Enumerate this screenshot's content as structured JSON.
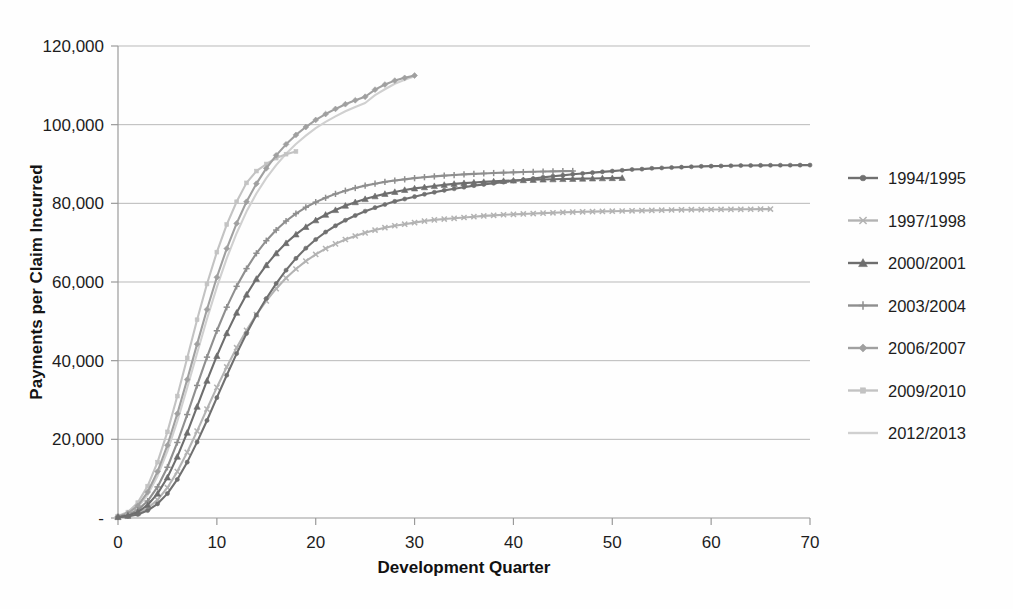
{
  "chart_data": {
    "type": "line",
    "title": "",
    "xlabel": "Development Quarter",
    "ylabel": "Payments per Claim Incurred",
    "xlim": [
      0,
      70
    ],
    "ylim": [
      0,
      120000
    ],
    "xticks": [
      0,
      10,
      20,
      30,
      40,
      50,
      60,
      70
    ],
    "xtick_labels": [
      "0",
      "10",
      "20",
      "30",
      "40",
      "50",
      "60",
      "70"
    ],
    "yticks": [
      0,
      20000,
      40000,
      60000,
      80000,
      100000,
      120000
    ],
    "ytick_labels": [
      "-",
      "20,000",
      "40,000",
      "60,000",
      "80,000",
      "100,000",
      "120,000"
    ],
    "grid": "horizontal",
    "legend_position": "right",
    "series": [
      {
        "name": "1994/1995",
        "marker": "circle",
        "color": "#707070",
        "x": [
          0,
          1,
          2,
          3,
          4,
          5,
          6,
          7,
          8,
          9,
          10,
          11,
          12,
          13,
          14,
          15,
          16,
          17,
          18,
          19,
          20,
          21,
          22,
          23,
          24,
          25,
          26,
          27,
          28,
          29,
          30,
          31,
          32,
          33,
          34,
          35,
          36,
          37,
          38,
          39,
          40,
          41,
          42,
          43,
          44,
          45,
          46,
          47,
          48,
          49,
          50,
          51,
          52,
          53,
          54,
          55,
          56,
          57,
          58,
          59,
          60,
          61,
          62,
          63,
          64,
          65,
          66,
          67,
          68,
          69,
          70
        ],
        "values": [
          200,
          400,
          900,
          1900,
          3600,
          6200,
          9800,
          14200,
          19300,
          24800,
          30600,
          36300,
          41800,
          46900,
          51600,
          55800,
          59600,
          63000,
          66000,
          68600,
          70800,
          72700,
          74300,
          75700,
          76900,
          78000,
          78900,
          79700,
          80500,
          81100,
          81700,
          82300,
          82800,
          83300,
          83700,
          84100,
          84500,
          84800,
          85100,
          85400,
          85700,
          86000,
          86300,
          86600,
          86900,
          87100,
          87400,
          87600,
          87800,
          88000,
          88200,
          88400,
          88600,
          88700,
          88900,
          89000,
          89100,
          89200,
          89300,
          89400,
          89450,
          89500,
          89550,
          89600,
          89620,
          89650,
          89670,
          89690,
          89700,
          89710,
          89720
        ]
      },
      {
        "name": "1997/1998",
        "marker": "x",
        "color": "#b3b3b3",
        "x": [
          0,
          1,
          2,
          3,
          4,
          5,
          6,
          7,
          8,
          9,
          10,
          11,
          12,
          13,
          14,
          15,
          16,
          17,
          18,
          19,
          20,
          21,
          22,
          23,
          24,
          25,
          26,
          27,
          28,
          29,
          30,
          31,
          32,
          33,
          34,
          35,
          36,
          37,
          38,
          39,
          40,
          41,
          42,
          43,
          44,
          45,
          46,
          47,
          48,
          49,
          50,
          51,
          52,
          53,
          54,
          55,
          56,
          57,
          58,
          59,
          60,
          61,
          62,
          63,
          64,
          65,
          66
        ],
        "values": [
          200,
          500,
          1200,
          2500,
          4600,
          7700,
          11800,
          16700,
          22100,
          27700,
          33200,
          38400,
          43300,
          47700,
          51700,
          55200,
          58300,
          61000,
          63300,
          65300,
          67000,
          68500,
          69700,
          70800,
          71700,
          72500,
          73200,
          73800,
          74300,
          74700,
          75100,
          75500,
          75800,
          76000,
          76200,
          76400,
          76600,
          76800,
          76950,
          77100,
          77200,
          77300,
          77400,
          77500,
          77600,
          77700,
          77780,
          77850,
          77900,
          77950,
          78000,
          78050,
          78100,
          78150,
          78200,
          78250,
          78300,
          78350,
          78380,
          78400,
          78430,
          78450,
          78470,
          78480,
          78500,
          78520,
          78540
        ]
      },
      {
        "name": "2000/2001",
        "marker": "triangle",
        "color": "#6e6e6e",
        "x": [
          0,
          1,
          2,
          3,
          4,
          5,
          6,
          7,
          8,
          9,
          10,
          11,
          12,
          13,
          14,
          15,
          16,
          17,
          18,
          19,
          20,
          21,
          22,
          23,
          24,
          25,
          26,
          27,
          28,
          29,
          30,
          31,
          32,
          33,
          34,
          35,
          36,
          37,
          38,
          39,
          40,
          41,
          42,
          43,
          44,
          45,
          46,
          47,
          48,
          49,
          50,
          51
        ],
        "values": [
          250,
          600,
          1500,
          3300,
          6200,
          10300,
          15600,
          21700,
          28300,
          34900,
          41200,
          47000,
          52200,
          56800,
          60800,
          64300,
          67300,
          69900,
          72100,
          74000,
          75700,
          77100,
          78300,
          79400,
          80300,
          81100,
          81800,
          82400,
          82900,
          83400,
          83800,
          84100,
          84400,
          84700,
          84950,
          85150,
          85300,
          85450,
          85580,
          85700,
          85800,
          85900,
          85980,
          86050,
          86120,
          86180,
          86230,
          86280,
          86330,
          86380,
          86420,
          86460
        ]
      },
      {
        "name": "2003/2004",
        "marker": "plus",
        "color": "#8f8f8f",
        "x": [
          0,
          1,
          2,
          3,
          4,
          5,
          6,
          7,
          8,
          9,
          10,
          11,
          12,
          13,
          14,
          15,
          16,
          17,
          18,
          19,
          20,
          21,
          22,
          23,
          24,
          25,
          26,
          27,
          28,
          29,
          30,
          31,
          32,
          33,
          34,
          35,
          36,
          37,
          38,
          39,
          40,
          41,
          42,
          43,
          44,
          45,
          46
        ],
        "values": [
          300,
          800,
          2000,
          4300,
          7900,
          12900,
          19200,
          26300,
          33700,
          40900,
          47600,
          53600,
          58900,
          63400,
          67300,
          70500,
          73200,
          75500,
          77400,
          79000,
          80300,
          81400,
          82400,
          83200,
          83900,
          84500,
          85000,
          85450,
          85800,
          86100,
          86400,
          86650,
          86850,
          87050,
          87200,
          87350,
          87480,
          87600,
          87700,
          87800,
          87880,
          87950,
          88020,
          88080,
          88130,
          88180,
          88220
        ]
      },
      {
        "name": "2006/2007",
        "marker": "diamond",
        "color": "#a0a0a0",
        "x": [
          0,
          1,
          2,
          3,
          4,
          5,
          6,
          7,
          8,
          9,
          10,
          11,
          12,
          13,
          14,
          15,
          16,
          17,
          18,
          19,
          20,
          21,
          22,
          23,
          24,
          25,
          26,
          27,
          28,
          29,
          30
        ],
        "values": [
          400,
          1200,
          3100,
          6600,
          11800,
          18500,
          26500,
          35200,
          44200,
          53000,
          61200,
          68500,
          74900,
          80400,
          85000,
          88900,
          92200,
          95000,
          97400,
          99400,
          101200,
          102700,
          104000,
          105200,
          106200,
          107100,
          108900,
          110200,
          111200,
          111900,
          112500
        ]
      },
      {
        "name": "2009/2010",
        "marker": "square",
        "color": "#c3c3c3",
        "x": [
          0,
          1,
          2,
          3,
          4,
          5,
          6,
          7,
          8,
          9,
          10,
          11,
          12,
          13,
          14,
          15,
          16,
          17,
          18
        ],
        "values": [
          500,
          1500,
          3900,
          8100,
          14200,
          21900,
          31000,
          40700,
          50400,
          59500,
          67600,
          74600,
          80400,
          85200,
          88200,
          90000,
          91500,
          92500,
          93200
        ]
      },
      {
        "name": "2012/2013",
        "marker": "none",
        "color": "#d0d0d0",
        "x": [
          0,
          1,
          2,
          3,
          4,
          5,
          6,
          7,
          8,
          9,
          10,
          11,
          12,
          13,
          14,
          15,
          16,
          17,
          18,
          19,
          20,
          21,
          22,
          23,
          24,
          25,
          26,
          27,
          28,
          29,
          30
        ],
        "values": [
          350,
          1000,
          2700,
          5900,
          10700,
          17000,
          24600,
          33100,
          41900,
          50600,
          58700,
          66000,
          72400,
          77900,
          82500,
          86400,
          89700,
          92600,
          95100,
          97200,
          99100,
          100700,
          102100,
          103400,
          104500,
          105500,
          107500,
          109000,
          110400,
          111400,
          112300
        ]
      }
    ]
  },
  "legend": {
    "entries": [
      {
        "label": "1994/1995"
      },
      {
        "label": "1997/1998"
      },
      {
        "label": "2000/2001"
      },
      {
        "label": "2003/2004"
      },
      {
        "label": "2006/2007"
      },
      {
        "label": "2009/2010"
      },
      {
        "label": "2012/2013"
      }
    ]
  }
}
